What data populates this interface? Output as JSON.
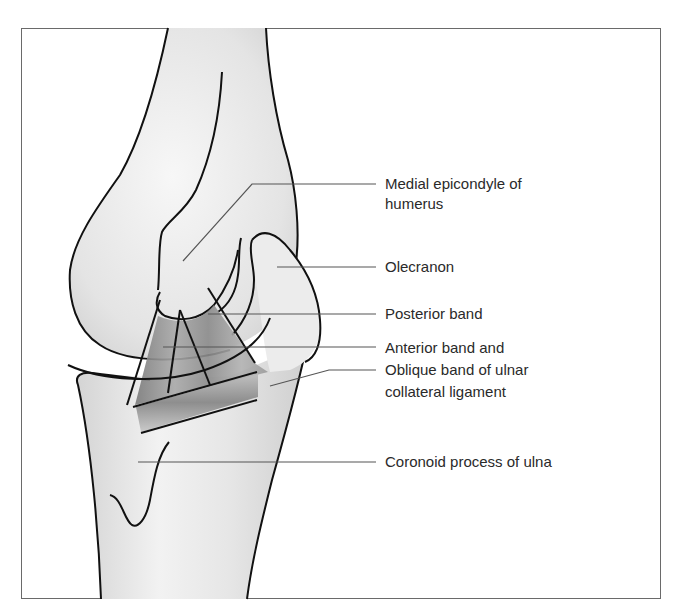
{
  "figure": {
    "colors": {
      "bone_fill": "#e6e6e6",
      "ligament": "#8a8a8a",
      "outline": "#111111",
      "leader": "#555555"
    }
  },
  "labels": [
    {
      "id": "medial-epicondyle",
      "lines": [
        "Medial epicondyle of",
        "humerus"
      ]
    },
    {
      "id": "olecranon",
      "lines": [
        "Olecranon"
      ]
    },
    {
      "id": "posterior-band",
      "lines": [
        "Posterior band"
      ]
    },
    {
      "id": "anterior-oblique-band",
      "lines": [
        "Anterior band and",
        "Oblique band of ulnar",
        "collateral ligament"
      ]
    },
    {
      "id": "coronoid-process",
      "lines": [
        "Coronoid process of ulna"
      ]
    }
  ]
}
